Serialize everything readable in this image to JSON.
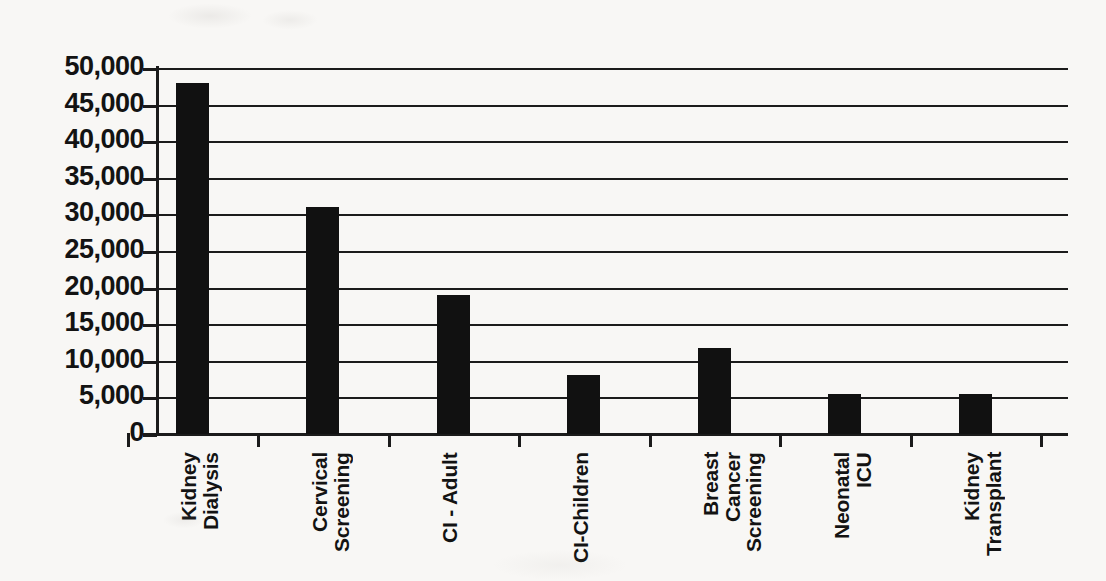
{
  "chart_data": {
    "type": "bar",
    "title": "",
    "subtitle": "",
    "xlabel": "",
    "ylabel": "",
    "categories": [
      "Kidney\nDialysis",
      "Cervical\nScreening",
      "CI - Adult",
      "CI-Children",
      "Breast\nCancer\nScreening",
      "Neonatal\nICU",
      "Kidney\nTransplant"
    ],
    "values": [
      48000,
      31000,
      19000,
      8000,
      11700,
      5500,
      5400
    ],
    "ylim": [
      0,
      50000
    ],
    "ytick_interval": 5000,
    "ytick_labels": [
      "50,000",
      "45,000",
      "40,000",
      "35,000",
      "30,000",
      "25,000",
      "20,000",
      "15,000",
      "10,000",
      "5,000",
      "0"
    ],
    "ytick_values": [
      50000,
      45000,
      40000,
      35000,
      30000,
      25000,
      20000,
      15000,
      10000,
      5000,
      0
    ],
    "grid": true,
    "grid_axis": "y",
    "legend": false,
    "legend_position": "none",
    "bar_color": "#111111",
    "axis_color": "#1b1b1b",
    "background_color": "#f8f7f5",
    "text_color": "#131313",
    "orientation": "vertical"
  }
}
